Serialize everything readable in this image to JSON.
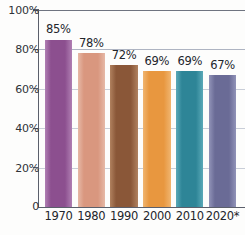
{
  "chart_data": {
    "type": "bar",
    "title": "",
    "subtitle": "",
    "xlabel": "",
    "ylabel": "",
    "categories": [
      "1970",
      "1980",
      "1990",
      "2000",
      "2010",
      "2020*"
    ],
    "values": [
      85,
      78,
      72,
      69,
      69,
      67
    ],
    "value_labels": [
      "85%",
      "78%",
      "72%",
      "69%",
      "69%",
      "67%"
    ],
    "ylim": [
      0,
      100
    ],
    "y_ticks": [
      0,
      20,
      40,
      60,
      80,
      100
    ],
    "y_tick_labels": [
      "0",
      "20%",
      "40%",
      "60%",
      "80%",
      "100%"
    ],
    "grid": true,
    "grid_axis": "y",
    "legend": "none",
    "bar_colors": [
      "#8c4f8f",
      "#d9977f",
      "#8a5738",
      "#e8973f",
      "#2e8597",
      "#6a6b96"
    ],
    "bar_colors_light": [
      "#b07fb3",
      "#e6b9a7",
      "#b0815f",
      "#f0b570",
      "#5aa9b8",
      "#9193b8"
    ]
  },
  "axis": {
    "axis_color": "#5b5f6b",
    "grid_color": "#aeb4c2"
  }
}
